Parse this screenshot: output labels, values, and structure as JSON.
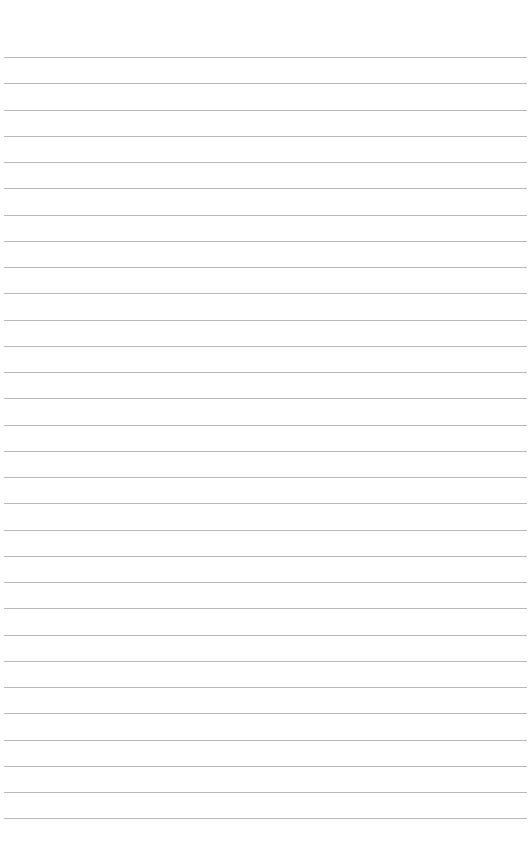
{
  "document": {
    "type": "lined-paper",
    "line_count": 30,
    "first_line_y": 57,
    "line_spacing": 26.25,
    "line_color": "#b8b8b8",
    "background": "#ffffff",
    "text_lines": []
  }
}
